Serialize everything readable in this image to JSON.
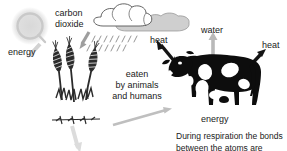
{
  "diagram": {
    "background_color": "#ffffff",
    "text_color": "#1a1a1a",
    "arrow_gray": "#b3b3b3",
    "arrow_dark": "#111111",
    "cloud_gray": "#cfcfcf",
    "plant_color": "#2b2b2b",
    "cow_color": "#0d0d0d"
  },
  "labels": {
    "energy_sun": "energy",
    "carbon_dioxide_line1": "carbon",
    "carbon_dioxide_line2": "dioxide",
    "heat_cloud": "heat",
    "water": "water",
    "heat_right": "heat",
    "eaten_line1": "eaten",
    "eaten_line2": "by animals",
    "eaten_line3": "and humans",
    "energy_cow": "energy"
  },
  "caption": {
    "line1": "During respiration the bonds",
    "line2": "between the atoms are broken"
  },
  "icons": {
    "sun": "sun-icon",
    "cloud": "cloud-icon",
    "rain": "rain-icon",
    "wheat": "wheat-plant-icon",
    "cow": "cow-icon",
    "arrow_sun_to_plant": "arrow-gray-down-left",
    "arrow_co2_to_plant": "arrow-gray-down-left",
    "arrow_heat_to_cloud": "arrow-dark-up-left",
    "arrow_water_up": "arrow-gray-up",
    "arrow_heat_up_right": "arrow-dark-up-right",
    "arrow_plant_to_cow": "arrow-gray-right",
    "arrow_plant_down": "arrow-gray-down"
  }
}
